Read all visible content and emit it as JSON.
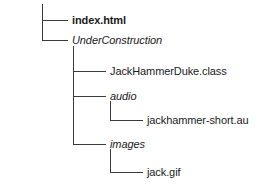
{
  "diagram": {
    "type": "file-tree",
    "title": "",
    "line_color": "#3a3a3a",
    "background_color": "#ffffff",
    "text_color": "#1a1a1a",
    "nodes": [
      {
        "id": "index-html",
        "label": "index.html",
        "level": 1,
        "style": "bold",
        "kind": "file"
      },
      {
        "id": "underconstruction",
        "label": "UnderConstruction",
        "level": 1,
        "style": "italic",
        "kind": "folder"
      },
      {
        "id": "jackhammerduke-class",
        "label": "JackHammerDuke.class",
        "level": 2,
        "style": "regular",
        "kind": "file"
      },
      {
        "id": "audio",
        "label": "audio",
        "level": 2,
        "style": "italic",
        "kind": "folder"
      },
      {
        "id": "jackhammer-short-au",
        "label": "jackhammer-short.au",
        "level": 3,
        "style": "regular",
        "kind": "file"
      },
      {
        "id": "images",
        "label": "images",
        "level": 2,
        "style": "italic",
        "kind": "folder"
      },
      {
        "id": "jack-gif",
        "label": "jack.gif",
        "level": 3,
        "style": "regular",
        "kind": "file"
      }
    ]
  }
}
